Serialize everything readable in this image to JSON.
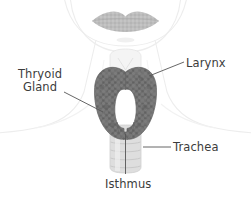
{
  "illustration": {
    "subject": "thyroid-gland-anatomy",
    "background_color": "#ffffff"
  },
  "colors": {
    "gland": "#6f6f6f",
    "gland_shadow": "#5e5e5e",
    "gland_speckle": "#838383",
    "trachea": "#dcdcdc",
    "trachea_ring": "#c9c9c9",
    "lips": "#b6b6b6",
    "body_outline": "#ededed",
    "label_text": "#3c3c3c",
    "leader_line": "#555555"
  },
  "labels": {
    "thyroid": {
      "line1": "Thryoid",
      "line2": "Gland"
    },
    "larynx": "Larynx",
    "trachea": "Trachea",
    "isthmus": "Isthmus"
  },
  "anatomy_parts": [
    "lips",
    "chin",
    "neck",
    "shoulders",
    "larynx",
    "thyroid-gland",
    "isthmus",
    "trachea"
  ]
}
